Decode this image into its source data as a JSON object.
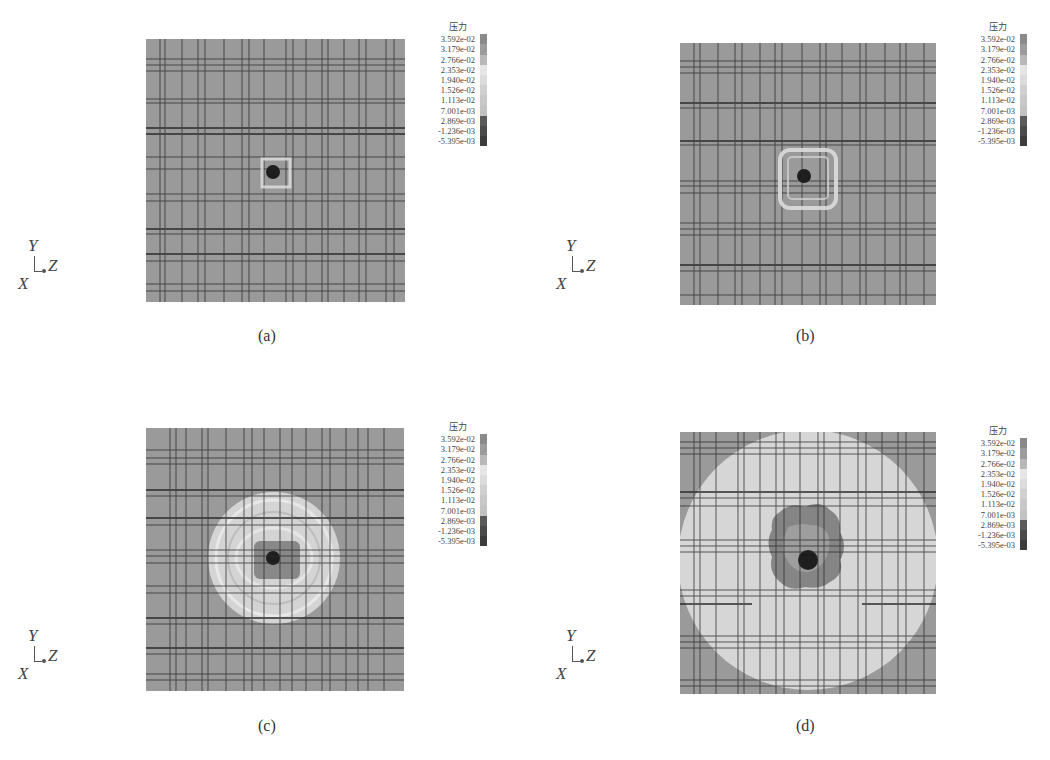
{
  "figure": {
    "panels": [
      {
        "id": "a",
        "caption": "(a)",
        "legend": {
          "title": "压力",
          "values": [
            "3.592e-02",
            "3.179e-02",
            "2.766e-02",
            "2.353e-02",
            "1.940e-02",
            "1.526e-02",
            "1.113e-02",
            "7.001e-03",
            "2.869e-03",
            "-1.236e-03",
            "-5.395e-03"
          ]
        },
        "axes": {
          "y": "Y",
          "x": "X",
          "z": "Z"
        },
        "pattern": "small dark spot with light square halo at center"
      },
      {
        "id": "b",
        "caption": "(b)",
        "legend": {
          "title": "压力",
          "values": [
            "3.592e-02",
            "3.179e-02",
            "2.766e-02",
            "2.353e-02",
            "1.940e-02",
            "1.526e-02",
            "1.113e-02",
            "7.001e-03",
            "2.869e-03",
            "-1.236e-03",
            "-5.395e-03"
          ]
        },
        "axes": {
          "y": "Y",
          "x": "X",
          "z": "Z"
        },
        "pattern": "dark spot with small light square ring"
      },
      {
        "id": "c",
        "caption": "(c)",
        "legend": {
          "title": "压力",
          "values": [
            "3.592e-02",
            "3.179e-02",
            "2.766e-02",
            "2.353e-02",
            "1.940e-02",
            "1.526e-02",
            "1.113e-02",
            "7.001e-03",
            "2.869e-03",
            "-1.236e-03",
            "-5.395e-03"
          ]
        },
        "axes": {
          "y": "Y",
          "x": "X",
          "z": "Z"
        },
        "pattern": "expanding light circular wavefront with dark core"
      },
      {
        "id": "d",
        "caption": "(d)",
        "legend": {
          "title": "压力",
          "values": [
            "3.592e-02",
            "3.179e-02",
            "2.766e-02",
            "2.353e-02",
            "1.940e-02",
            "1.526e-02",
            "1.113e-02",
            "7.001e-03",
            "2.869e-03",
            "-1.236e-03",
            "-5.395e-03"
          ]
        },
        "axes": {
          "y": "Y",
          "x": "X",
          "z": "Z"
        },
        "pattern": "large light circle filling plot with dark irregular core"
      }
    ],
    "colors": {
      "background_field": "#9a9a9a",
      "grid_lines": "#2a2a2a",
      "wave_light": "#d4d4d4",
      "core_dark": "#1e1e1e",
      "legend_swatches": [
        "#8a8a8a",
        "#9c9c9c",
        "#b8b8b8",
        "#e6e6e6",
        "#dcdcdc",
        "#d0d0d0",
        "#c8c8c8",
        "#c2c2c2",
        "#5a5a5a",
        "#4a4a4a",
        "#3c3c3c"
      ]
    }
  }
}
